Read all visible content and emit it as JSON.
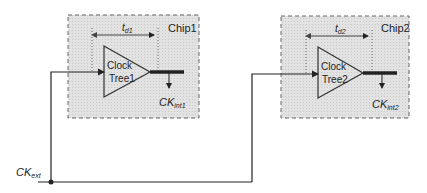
{
  "diagram": {
    "chip1": {
      "name": "Chip1",
      "block_line1": "Clock",
      "block_line2": "Tree1",
      "delay_main": "t",
      "delay_sub": "d1",
      "out_main": "CK",
      "out_sub": "int1"
    },
    "chip2": {
      "name": "Chip2",
      "block_line1": "Clock",
      "block_line2": "Tree2",
      "delay_main": "t",
      "delay_sub": "d2",
      "out_main": "CK",
      "out_sub": "int2"
    },
    "ext": {
      "main": "CK",
      "sub": "ext"
    },
    "colors": {
      "chip_fill": "#dcdcdc",
      "line": "#222222",
      "border": "#666666"
    }
  }
}
